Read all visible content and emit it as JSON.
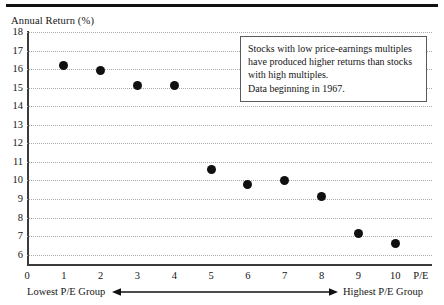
{
  "chart_data": {
    "type": "scatter",
    "title": "",
    "xlabel": "P/E",
    "ylabel": "Annual Return (%)",
    "x": [
      1,
      2,
      3,
      4,
      5,
      6,
      7,
      8,
      9,
      10
    ],
    "values": [
      16.2,
      15.9,
      15.1,
      15.1,
      10.6,
      9.8,
      10.0,
      9.15,
      7.15,
      6.6
    ],
    "categories": [
      "1",
      "2",
      "3",
      "4",
      "5",
      "6",
      "7",
      "8",
      "9",
      "10"
    ],
    "series": [
      {
        "name": "Annual Return (%)",
        "values": [
          16.2,
          15.9,
          15.1,
          15.1,
          10.6,
          9.8,
          10.0,
          9.15,
          7.15,
          6.6
        ]
      }
    ],
    "xlim": [
      0,
      11
    ],
    "ylim": [
      5.5,
      18
    ],
    "x_ticks": [
      "0",
      "1",
      "2",
      "3",
      "4",
      "5",
      "6",
      "7",
      "8",
      "9",
      "10"
    ],
    "y_ticks": [
      "18",
      "17",
      "16",
      "15",
      "14",
      "13",
      "12",
      "11",
      "10",
      "9",
      "8",
      "7",
      "6"
    ],
    "grid": true,
    "grid_axis": "y",
    "legend": "none",
    "marker": "filled-circle",
    "marker_color": "#101010",
    "annotations": [
      "Stocks with low price-earnings multiples",
      "have produced higher returns than stocks",
      "with high multiples.",
      "Data beginning in 1967."
    ],
    "axis_note_left": "Lowest P/E Group",
    "axis_note_right": "Highest P/E Group",
    "axis_note_arrow": "double-headed-arrow"
  },
  "axes": {
    "y_title": "Annual Return (%)",
    "x_end_label": "P/E",
    "y_ticks": [
      "18",
      "17",
      "16",
      "15",
      "14",
      "13",
      "12",
      "11",
      "10",
      "9",
      "8",
      "7",
      "6"
    ],
    "x_ticks": [
      "0",
      "1",
      "2",
      "3",
      "4",
      "5",
      "6",
      "7",
      "8",
      "9",
      "10"
    ]
  },
  "annotation": {
    "lines": [
      "Stocks with low price-earnings multiples",
      "have produced higher returns than stocks",
      "with high multiples.",
      "Data beginning in 1967."
    ],
    "line1": "Stocks with low price-earnings multiples",
    "line2": "have produced higher returns than stocks",
    "line3": "with high multiples.",
    "line4": "Data beginning in 1967."
  },
  "caption": {
    "left": "Lowest P/E Group",
    "right": "Highest P/E Group"
  },
  "colors": {
    "marker": "#101010",
    "grid": "#a9a9a9",
    "axis": "#3b3b3b",
    "rule": "#111111",
    "text": "#151515"
  }
}
